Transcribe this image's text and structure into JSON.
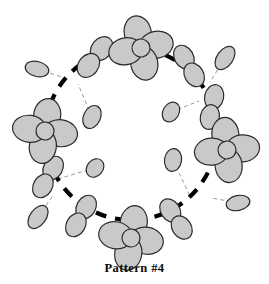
{
  "figure": {
    "caption": "Pattern #4",
    "title": "Pattern #4",
    "width": 269,
    "height": 284
  },
  "colors": {
    "background": "#ffffff",
    "petal_fill": "#c9c9c9",
    "petal_stroke": "#2b2b2b",
    "center_fill": "#c9c9c9",
    "orbit_stroke": "#000000",
    "stem_stroke": "#9a9a9a",
    "caption_color": "#0a0a0a"
  },
  "orbit": {
    "label": "dashed-orbit-circle",
    "center_x": 131,
    "center_y": 134,
    "radius": 86,
    "stroke_width": 4.2,
    "dash": "11 9",
    "style": "dashed"
  },
  "clusters": [
    {
      "id": "cluster-top",
      "label": "four-petal-cluster-top",
      "x": 141,
      "y": 48,
      "rotation": -12,
      "petals": 4,
      "petal_rx": 13.5,
      "petal_ry": 17,
      "center_r": 9,
      "scale": 1.0
    },
    {
      "id": "cluster-left",
      "label": "four-petal-cluster-left",
      "x": 45,
      "y": 131,
      "rotation": 8,
      "petals": 4,
      "petal_rx": 13.5,
      "petal_ry": 17,
      "center_r": 9,
      "scale": 1.0
    },
    {
      "id": "cluster-right",
      "label": "four-petal-cluster-right",
      "x": 227,
      "y": 150,
      "rotation": -6,
      "petals": 4,
      "petal_rx": 13.5,
      "petal_ry": 17,
      "center_r": 9,
      "scale": 1.0
    },
    {
      "id": "cluster-bottom",
      "label": "four-petal-cluster-bottom",
      "x": 131,
      "y": 238,
      "rotation": 10,
      "petals": 4,
      "petal_rx": 13.5,
      "petal_ry": 17,
      "center_r": 9,
      "scale": 1.0
    }
  ],
  "pairs": [
    {
      "id": "pair-upper-left",
      "label": "two-petal-pair-upper-left",
      "x": 95,
      "y": 57,
      "rotation": 38,
      "petals": 2,
      "petal_rx": 10,
      "petal_ry": 13
    },
    {
      "id": "pair-upper-right",
      "label": "two-petal-pair-upper-right",
      "x": 189,
      "y": 66,
      "rotation": -30,
      "petals": 2,
      "petal_rx": 9.5,
      "petal_ry": 12.5
    },
    {
      "id": "pair-right-upper",
      "label": "two-petal-pair-right-upper",
      "x": 212,
      "y": 107,
      "rotation": 12,
      "petals": 2,
      "petal_rx": 9.5,
      "petal_ry": 12.5
    },
    {
      "id": "pair-left-lower",
      "label": "two-petal-pair-left-lower",
      "x": 48,
      "y": 177,
      "rotation": 30,
      "petals": 2,
      "petal_rx": 9.5,
      "petal_ry": 12.5
    },
    {
      "id": "pair-lower-left",
      "label": "two-petal-pair-lower-left",
      "x": 81,
      "y": 216,
      "rotation": 30,
      "petals": 2,
      "petal_rx": 9.5,
      "petal_ry": 12.5
    },
    {
      "id": "pair-lower-right",
      "label": "two-petal-pair-lower-right",
      "x": 176,
      "y": 219,
      "rotation": -34,
      "petals": 2,
      "petal_rx": 9.5,
      "petal_ry": 12.5
    }
  ],
  "satellites": [
    {
      "id": "sat-inner-upper-left",
      "label": "inner-ellipse-upper-left",
      "x": 92,
      "y": 117,
      "rx": 8.5,
      "ry": 12,
      "rotation": 25,
      "stem_to_x": 78,
      "stem_to_y": 84,
      "region": "inside"
    },
    {
      "id": "sat-inner-upper-right",
      "label": "inner-ellipse-upper-right",
      "x": 171,
      "y": 112,
      "rx": 8,
      "ry": 10.5,
      "rotation": 30,
      "stem_to_x": 199,
      "stem_to_y": 101,
      "region": "inside"
    },
    {
      "id": "sat-inner-right",
      "label": "inner-ellipse-right",
      "x": 173,
      "y": 160,
      "rx": 8.5,
      "ry": 11.5,
      "rotation": 8,
      "stem_to_x": 190,
      "stem_to_y": 196,
      "region": "inside"
    },
    {
      "id": "sat-inner-lower-left",
      "label": "inner-ellipse-lower-left",
      "x": 95,
      "y": 168,
      "rx": 8,
      "ry": 10,
      "rotation": 40,
      "stem_to_x": 54,
      "stem_to_y": 180,
      "region": "inside"
    },
    {
      "id": "sat-outer-left",
      "label": "outer-ellipse-left",
      "x": 37,
      "y": 69,
      "rx": 12,
      "ry": 7.5,
      "rotation": 14,
      "stem_to_x": 65,
      "stem_to_y": 78,
      "region": "outside"
    },
    {
      "id": "sat-outer-top-right",
      "label": "outer-ellipse-top-right",
      "x": 225,
      "y": 58,
      "rx": 8,
      "ry": 13,
      "rotation": 35,
      "stem_to_x": 210,
      "stem_to_y": 82,
      "region": "outside"
    },
    {
      "id": "sat-outer-bottom-left",
      "label": "outer-ellipse-bottom-left",
      "x": 38,
      "y": 217,
      "rx": 8,
      "ry": 13,
      "rotation": 36,
      "stem_to_x": 54,
      "stem_to_y": 194,
      "region": "outside"
    },
    {
      "id": "sat-outer-bottom-right",
      "label": "outer-ellipse-bottom-right",
      "x": 238,
      "y": 203,
      "rx": 12,
      "ry": 7.5,
      "rotation": -12,
      "stem_to_x": 212,
      "stem_to_y": 198,
      "region": "outside"
    }
  ]
}
